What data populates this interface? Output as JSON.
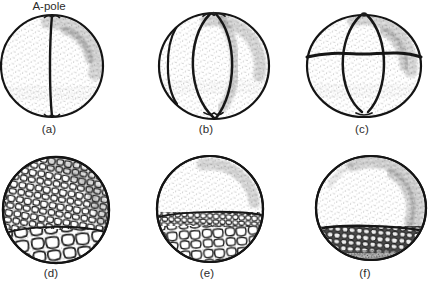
{
  "figure": {
    "paper_color": "#ffffff",
    "ink_color": "#1a1a1a",
    "pole_label": "A-pole",
    "panels": [
      {
        "caption": "(a)"
      },
      {
        "caption": "(b)"
      },
      {
        "caption": "(c)"
      },
      {
        "caption": "(d)"
      },
      {
        "caption": "(e)"
      },
      {
        "caption": "(f)"
      }
    ]
  }
}
